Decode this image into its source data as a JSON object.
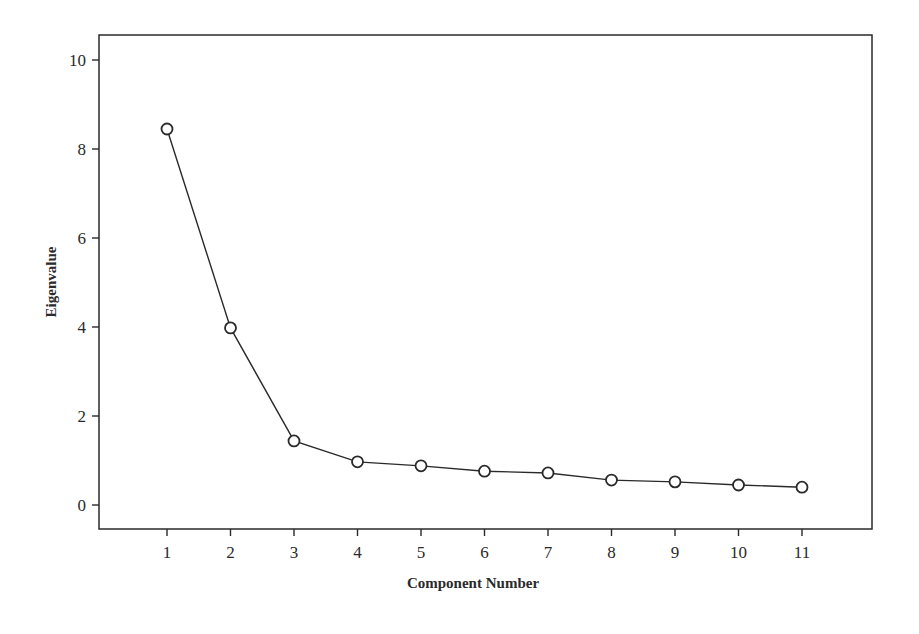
{
  "chart_data": {
    "type": "line",
    "title": "",
    "xlabel": "Component Number",
    "ylabel": "Eigenvalue",
    "x": [
      1,
      2,
      3,
      4,
      5,
      6,
      7,
      8,
      9,
      10,
      11
    ],
    "categories": [
      "1",
      "2",
      "3",
      "4",
      "5",
      "6",
      "7",
      "8",
      "9",
      "10",
      "11"
    ],
    "series": [
      {
        "name": "Eigenvalue",
        "values": [
          8.45,
          3.98,
          1.44,
          0.97,
          0.88,
          0.76,
          0.72,
          0.56,
          0.52,
          0.45,
          0.4
        ],
        "marker": "open-circle",
        "color": "#2a2a2a"
      }
    ],
    "xticks": [
      "1",
      "2",
      "3",
      "4",
      "5",
      "6",
      "7",
      "8",
      "9",
      "10",
      "11"
    ],
    "yticks": [
      "0",
      "2",
      "4",
      "6",
      "8",
      "10"
    ],
    "ylim": [
      -0.55,
      10.55
    ],
    "xlim": [
      -0.05,
      12.15
    ],
    "grid": false,
    "legend": null
  }
}
